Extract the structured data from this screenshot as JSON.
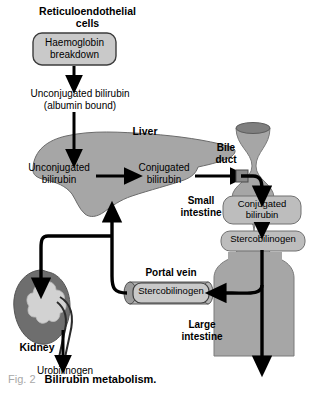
{
  "figure": {
    "caption_prefix": "Fig. 2",
    "caption_title": "Bilirubin metabolism.",
    "domain": "medical-flow-diagram"
  },
  "colors": {
    "background": "#ffffff",
    "organ_fill": "#a6a6a6",
    "organ_stroke": "#4a4a4a",
    "box_fill": "#c9c9c9",
    "box_stroke": "#3c3c3c",
    "kidney_fill": "#6e6e6e",
    "kidney_inner": "#d0d0d0",
    "vein_fill": "#b5b5b5",
    "duct_cap": "#7a7a7a",
    "arrow": "#000000",
    "text": "#000000",
    "caption_prefix_color": "#a8a8a8"
  },
  "labels": {
    "reticuloendothelial": "Reticuloendothelial",
    "cells": "cells",
    "haemoglobin": "Haemoglobin",
    "breakdown": "breakdown",
    "unconjugated_bilirubin_top": "Unconjugated bilirubin",
    "albumin_bound": "(albumin bound)",
    "liver": "Liver",
    "unconjugated_line1": "Unconjugated",
    "unconjugated_line2": "bilirubin",
    "conjugated_line1": "Conjugated",
    "conjugated_line2": "bilirubin",
    "bile_line1": "Bile",
    "bile_line2": "duct",
    "small_line1": "Small",
    "small_line2": "intestine",
    "conjugated_gut_line1": "Conjugated",
    "conjugated_gut_line2": "bilirubin",
    "stercobilinogen_gut": "Stercobilinogen",
    "portal_vein": "Portal vein",
    "stercobilinogen_vein": "Stercobilinogen",
    "large_line1": "Large",
    "large_line2": "intestine",
    "kidney": "Kidney",
    "urobilinogen": "Urobilinogen"
  },
  "nodes": [
    {
      "name": "haemoglobin-breakdown-box",
      "kind": "rounded-box",
      "text": "Haemoglobin breakdown"
    },
    {
      "name": "liver-organ",
      "kind": "organ-shape",
      "text": "Liver"
    },
    {
      "name": "small-intestine-organ",
      "kind": "organ-shape",
      "text": "Small intestine"
    },
    {
      "name": "large-intestine-organ",
      "kind": "organ-shape",
      "text": "Large intestine"
    },
    {
      "name": "kidney-organ",
      "kind": "organ-shape",
      "text": "Kidney"
    },
    {
      "name": "portal-vein-cylinder",
      "kind": "cylinder",
      "text": "Portal vein"
    }
  ],
  "flow": [
    {
      "from": "Haemoglobin breakdown",
      "to": "Unconjugated bilirubin (albumin bound)"
    },
    {
      "from": "Unconjugated bilirubin (albumin bound)",
      "to": "Unconjugated bilirubin (liver)"
    },
    {
      "from": "Unconjugated bilirubin (liver)",
      "to": "Conjugated bilirubin (liver)"
    },
    {
      "from": "Conjugated bilirubin (liver)",
      "to": "Bile duct"
    },
    {
      "from": "Bile duct",
      "to": "Conjugated bilirubin (small intestine)"
    },
    {
      "from": "Conjugated bilirubin (small intestine)",
      "to": "Stercobilinogen (small intestine)"
    },
    {
      "from": "Stercobilinogen (large intestine)",
      "to": "Portal vein Stercobilinogen"
    },
    {
      "from": "Portal vein Stercobilinogen",
      "to": "Liver"
    },
    {
      "from": "Portal vein Stercobilinogen",
      "to": "Kidney"
    },
    {
      "from": "Kidney",
      "to": "Urobilinogen"
    },
    {
      "from": "Large intestine",
      "to": "excretion"
    }
  ]
}
